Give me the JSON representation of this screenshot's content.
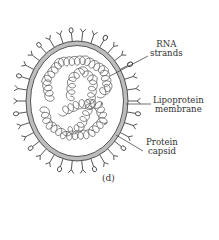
{
  "figure": {
    "caption": "(d)",
    "colors": {
      "line": "#444444",
      "membrane_fill": "#b8b8b8",
      "background": "#ffffff"
    }
  },
  "labels": [
    {
      "id": "rna",
      "line1": "RNA",
      "line2": "strands"
    },
    {
      "id": "membrane",
      "line1": "Lipoprotein",
      "line2": "membrane"
    },
    {
      "id": "capsid",
      "line1": "Protein",
      "line2": "capsid"
    }
  ]
}
